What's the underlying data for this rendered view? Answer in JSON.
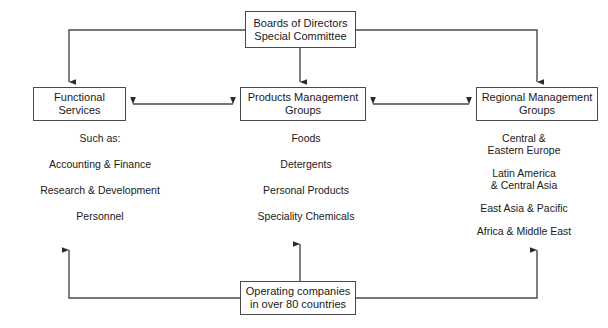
{
  "diagram": {
    "title_text": "",
    "line_color": "#4a4a4a",
    "text_color": "#1a1a1a",
    "background": "#ffffff",
    "nodes": {
      "board": "Boards of Directors\nSpecial Committee",
      "functional": "Functional\nServices",
      "products": "Products Management\nGroups",
      "regional": "Regional Management\nGroups",
      "operating": "Operating companies\nin over 80 countries"
    },
    "columns": {
      "functional": {
        "items": [
          "Such as:",
          "Accounting & Finance",
          "Research & Development",
          "Personnel"
        ]
      },
      "products": {
        "items": [
          "Foods",
          "Detergents",
          "Personal Products",
          "Speciality Chemicals"
        ]
      },
      "regional": {
        "items": [
          "Central &\nEastern Europe",
          "Latin America\n& Central Asia",
          "East Asia & Pacific",
          "Africa & Middle East"
        ]
      }
    }
  }
}
